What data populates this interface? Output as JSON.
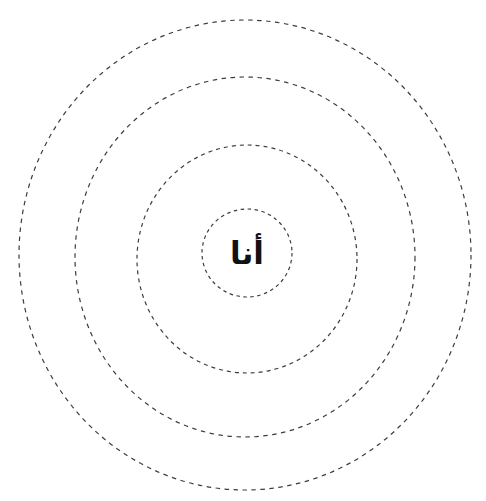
{
  "page": {
    "background_color": "#ffffff",
    "width": 486,
    "height": 501
  },
  "diagram": {
    "kind": "concentric-dashed-circles",
    "ring_count": 4,
    "stroke_color": "#3c3c44",
    "dash_pattern": "4 4",
    "stroke_width": 1.2,
    "rings": [
      {
        "name": "ring-outer",
        "index": 1,
        "cx": 245,
        "cy": 255,
        "rx": 226,
        "ry": 235,
        "dash": "4.5 4.5",
        "stroke_width": 1.2
      },
      {
        "name": "ring-second",
        "index": 2,
        "cx": 245,
        "cy": 257,
        "rx": 170,
        "ry": 180,
        "dash": "4.5 4.5",
        "stroke_width": 1.2
      },
      {
        "name": "ring-third",
        "index": 3,
        "cx": 247,
        "cy": 259,
        "rx": 110,
        "ry": 114,
        "dash": "4 4",
        "stroke_width": 1.2
      },
      {
        "name": "ring-inner",
        "index": 4,
        "cx": 247,
        "cy": 253,
        "rx": 45,
        "ry": 44,
        "dash": "3.5 3.5",
        "stroke_width": 1.2
      }
    ]
  },
  "center": {
    "label": "أنا",
    "color": "#111111",
    "font_size": 31,
    "x": 247,
    "y": 255
  }
}
